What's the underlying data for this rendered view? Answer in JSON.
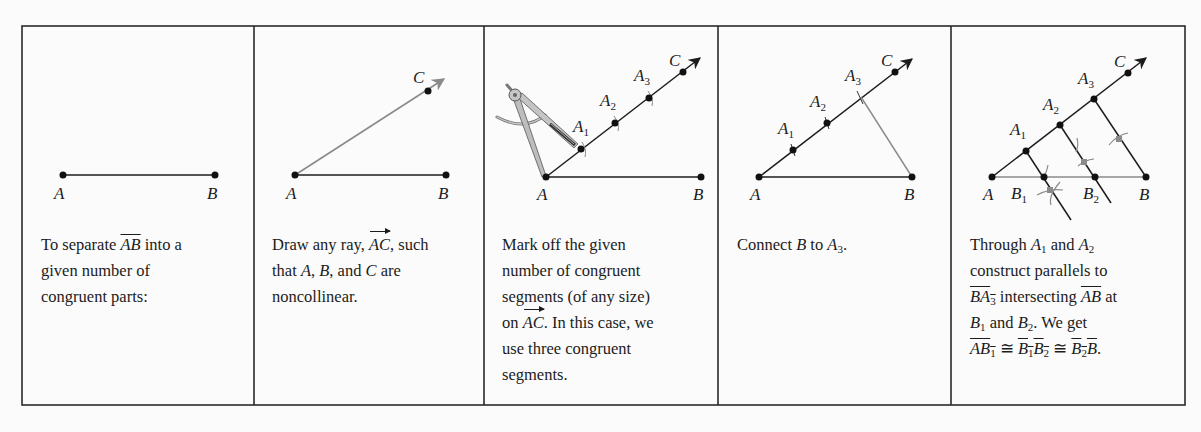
{
  "figure": {
    "panels": [
      {
        "id": "step-0",
        "points": {
          "A": "A",
          "B": "B"
        },
        "caption": {
          "part1": "To separate ",
          "seg": "AB",
          "part2": " into a",
          "line2": "given number of",
          "line3": "congruent parts:"
        }
      },
      {
        "id": "step-1",
        "points": {
          "A": "A",
          "B": "B",
          "C": "C"
        },
        "caption": {
          "part1": "Draw any ray, ",
          "ray": "AC",
          "part2": ", such",
          "line2a": "that ",
          "A": "A",
          "sep1": ", ",
          "B": "B",
          "sep2": ", and ",
          "C": "C",
          "line2b": " are",
          "line3": "noncollinear."
        }
      },
      {
        "id": "step-2",
        "points": {
          "A": "A",
          "B": "B",
          "C": "C",
          "A1": "A",
          "A2": "A",
          "A3": "A",
          "sub1": "1",
          "sub2": "2",
          "sub3": "3"
        },
        "caption": {
          "line1": "Mark off the given",
          "line2": "number of congruent",
          "line3": "segments (of any size)",
          "line4a": "on ",
          "ray": "AC",
          "line4b": ". In this case, we",
          "line5": "use three congruent",
          "line6": "segments."
        }
      },
      {
        "id": "step-3",
        "points": {
          "A": "A",
          "B": "B",
          "C": "C",
          "A1": "A",
          "A2": "A",
          "A3": "A",
          "sub1": "1",
          "sub2": "2",
          "sub3": "3"
        },
        "caption": {
          "part1": "Connect ",
          "B": "B",
          "part2": " to ",
          "A": "A",
          "sub": "3",
          "part3": "."
        }
      },
      {
        "id": "step-4",
        "points": {
          "A": "A",
          "B": "B",
          "C": "C",
          "A1": "A",
          "A2": "A",
          "A3": "A",
          "B1": "B",
          "B2": "B",
          "sub1": "1",
          "sub2": "2",
          "sub3": "3"
        },
        "caption": {
          "l1a": "Through ",
          "l1A": "A",
          "l1s1": "1",
          "l1b": " and ",
          "l1A2": "A",
          "l1s2": "2",
          "l2": "construct parallels to",
          "l3seg": "BA",
          "l3sub": "3",
          "l3b": " intersecting ",
          "l3seg2": "AB",
          "l3c": " at",
          "l4B": "B",
          "l4s1": "1",
          "l4b": " and ",
          "l4B2": "B",
          "l4s2": "2",
          "l4c": ". We get",
          "l5seg1": "AB",
          "l5s1": "1",
          "l5cong1": " ≅ ",
          "l5seg2a": "B",
          "l5seg2s1": "1",
          "l5seg2b": "B",
          "l5seg2s2": "2",
          "l5cong2": " ≅ ",
          "l5seg3a": "B",
          "l5seg3s": "2",
          "l5seg3b": "B",
          "l5end": "."
        }
      }
    ],
    "colors": {
      "ink": "#1c1c1c",
      "construction_gray": "#8a8a8a",
      "border": "#2a2a2a",
      "background": "#fbfbfb"
    }
  }
}
